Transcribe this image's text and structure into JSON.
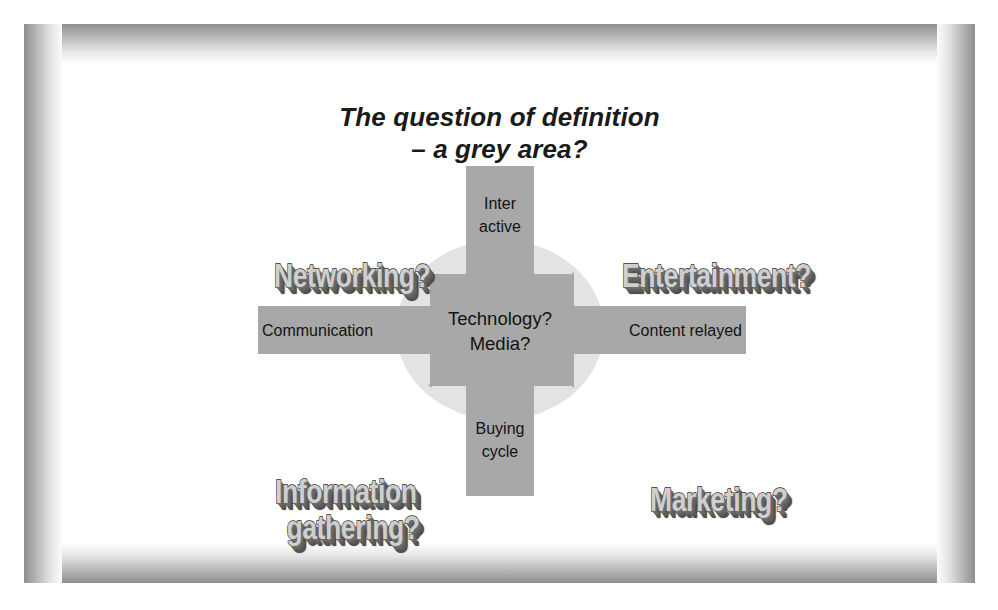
{
  "slide": {
    "title_line1": "The question of definition",
    "title_line2": "– a grey area?"
  },
  "diagram": {
    "type": "converging-arrows",
    "center": {
      "line1": "Technology?",
      "line2": "Media?"
    },
    "arrows": [
      {
        "id": "top",
        "direction": "down",
        "line1": "Inter",
        "line2": "active"
      },
      {
        "id": "left",
        "direction": "right",
        "line1": "Communication",
        "line2": ""
      },
      {
        "id": "right",
        "direction": "left",
        "line1": "Content relayed",
        "line2": ""
      },
      {
        "id": "bottom",
        "direction": "up",
        "line1": "Buying",
        "line2": "cycle"
      }
    ],
    "corner_labels": [
      {
        "id": "top-left",
        "line1": "Networking?",
        "line2": ""
      },
      {
        "id": "top-right",
        "line1": "Entertainment?",
        "line2": ""
      },
      {
        "id": "bottom-left",
        "line1": "Information",
        "line2": "gathering?"
      },
      {
        "id": "bottom-right",
        "line1": "Marketing?",
        "line2": ""
      }
    ]
  },
  "colors": {
    "arrow_fill": "#a8a8a8",
    "ellipse_fill": "#e3e3e3",
    "text": "#131313",
    "frame_dark": "#8f8f8f",
    "frame_light": "#ffffff",
    "wordart_face": "#cfcfcf",
    "wordart_shadow": "#585858"
  }
}
